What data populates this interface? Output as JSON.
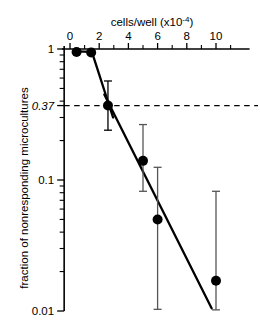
{
  "chart_data": {
    "type": "scatter",
    "title": "",
    "xlabel": "cells/well (×10⁻⁴)",
    "ylabel": "fraction of nonresponding microcultures",
    "xlabel_parts": {
      "text": "cells/well (x10",
      "sup": "-4",
      "tail": ")"
    },
    "x_ticks": [
      0,
      2,
      4,
      6,
      8,
      10
    ],
    "x_tick_labels": [
      "0",
      "2",
      "4",
      "6",
      "8",
      "10"
    ],
    "x_minor_ticks": [
      1,
      3,
      5,
      7,
      9,
      11
    ],
    "xlim": [
      -0.4,
      12.3
    ],
    "yscale": "log",
    "ylim": [
      0.01,
      1.15
    ],
    "y_ticks": [
      1,
      0.37,
      0.1,
      0.01
    ],
    "y_tick_labels": [
      "1",
      "0.37",
      "0.1",
      "0.01"
    ],
    "y_tick_italic": [
      false,
      true,
      false,
      false
    ],
    "y_minor_ticks": [
      0.9,
      0.8,
      0.7,
      0.6,
      0.5,
      0.4,
      0.3,
      0.2,
      0.09,
      0.08,
      0.07,
      0.06,
      0.05,
      0.04,
      0.03,
      0.02
    ],
    "grid": false,
    "legend": "none",
    "reference_line": {
      "y": 0.37,
      "label": "0.37",
      "style": "dashed"
    },
    "points": [
      {
        "x": 0.45,
        "y": 0.95,
        "yerr_low": 0.95,
        "yerr_high": 0.95
      },
      {
        "x": 1.45,
        "y": 0.94,
        "yerr_low": 0.94,
        "yerr_high": 0.94
      },
      {
        "x": 2.6,
        "y": 0.37,
        "yerr_low": 0.24,
        "yerr_high": 0.57
      },
      {
        "x": 5.0,
        "y": 0.14,
        "yerr_low": 0.082,
        "yerr_high": 0.265
      },
      {
        "x": 6.0,
        "y": 0.05,
        "yerr_low": 0.0103,
        "yerr_high": 0.125
      },
      {
        "x": 10.0,
        "y": 0.017,
        "yerr_low": 0.0102,
        "yerr_high": 0.082
      }
    ],
    "fit_segments": [
      {
        "x1": 0.45,
        "y1": 0.96,
        "x2": 1.45,
        "y2": 0.95
      },
      {
        "x1": 1.5,
        "y1": 0.95,
        "x2": 2.95,
        "y2": 0.3
      },
      {
        "x1": 2.35,
        "y1": 0.45,
        "x2": 9.7,
        "y2": 0.0105
      }
    ]
  },
  "figure": {
    "background": "#ffffff",
    "foreground": "#000000",
    "errorbar_color": "#555555"
  }
}
